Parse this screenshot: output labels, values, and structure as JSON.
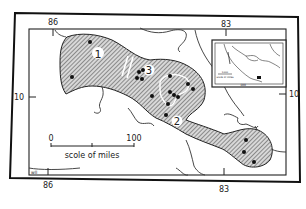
{
  "map": {
    "longitude_ticks": {
      "left": "86",
      "right": "83"
    },
    "latitude_ticks": {
      "left": "10",
      "right": "10"
    },
    "regions": [
      {
        "id": "1",
        "label": "1"
      },
      {
        "id": "2",
        "label": "2"
      },
      {
        "id": "3",
        "label": "3"
      }
    ],
    "scale": {
      "start": "0",
      "end": "100",
      "caption": "scole of miles"
    },
    "credit": "wll",
    "inset": {
      "scale_label": "1000",
      "scale_caption": "scale of miles",
      "longitude_tick": "100"
    },
    "colors": {
      "ink": "#1a1a1a",
      "paper": "#ffffff",
      "hatch": "#555555"
    }
  }
}
